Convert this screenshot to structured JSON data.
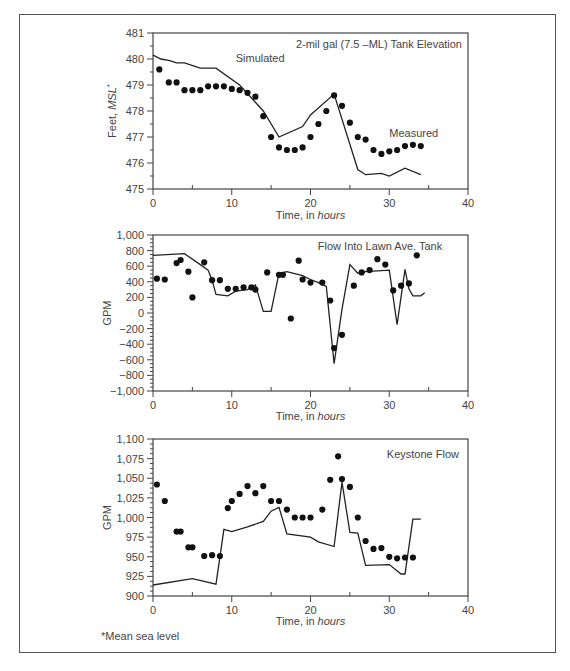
{
  "footnote": "*Mean sea level",
  "chart_data": [
    {
      "type": "line+scatter",
      "title": "2-mil gal (7.5 –ML) Tank Elevation",
      "xlabel": "Time, in hours",
      "ylabel": "Feet, MSL*",
      "xlim": [
        0,
        40
      ],
      "ylim": [
        475,
        481
      ],
      "xticks": [
        0,
        10,
        20,
        30,
        40
      ],
      "yticks": [
        475,
        476,
        477,
        478,
        479,
        480,
        481
      ],
      "ytick_labels": [
        "475",
        "476",
        "477",
        "478",
        "479",
        "480",
        "481"
      ],
      "annotations": [
        {
          "text": "Simulated",
          "x": 10.5,
          "y": 479.9
        },
        {
          "text": "Measured",
          "x": 30,
          "y": 477
        }
      ],
      "series": [
        {
          "name": "Simulated",
          "style": "line",
          "x": [
            0,
            1,
            2,
            3,
            4,
            6,
            8,
            11,
            14,
            16,
            19,
            20,
            23,
            26,
            27,
            29,
            30,
            32,
            34
          ],
          "y": [
            480.15,
            480.0,
            479.95,
            479.85,
            479.85,
            479.65,
            479.65,
            479.0,
            478.0,
            477.0,
            477.4,
            477.85,
            478.65,
            475.75,
            475.55,
            475.6,
            475.5,
            475.8,
            475.55
          ]
        },
        {
          "name": "Measured",
          "style": "dots",
          "x": [
            0.8,
            2,
            3,
            4,
            5,
            6,
            7,
            8,
            9,
            10,
            11,
            12,
            13,
            14,
            15,
            16,
            17,
            18,
            19,
            20,
            21,
            22,
            23,
            24,
            25,
            26,
            27,
            28,
            29,
            30,
            31,
            32,
            33,
            34
          ],
          "y": [
            479.6,
            479.1,
            479.1,
            478.8,
            478.8,
            478.8,
            478.95,
            478.95,
            478.95,
            478.85,
            478.8,
            478.7,
            478.55,
            477.8,
            477.0,
            476.6,
            476.5,
            476.5,
            476.6,
            477.0,
            477.5,
            478.0,
            478.6,
            478.2,
            477.55,
            477.0,
            476.9,
            476.5,
            476.35,
            476.45,
            476.5,
            476.65,
            476.7,
            476.65
          ]
        }
      ]
    },
    {
      "type": "line+scatter",
      "title": "Flow Into Lawn Ave. Tank",
      "xlabel": "",
      "ylabel": "GPM",
      "xlim": [
        0,
        40
      ],
      "ylim": [
        -1000,
        1000
      ],
      "xticks": [
        0,
        10,
        20,
        30,
        40
      ],
      "yticks": [
        -1000,
        -800,
        -600,
        -400,
        -200,
        0,
        200,
        400,
        600,
        800,
        1000
      ],
      "ytick_labels": [
        "−1,000",
        "−800",
        "−600",
        "−400",
        "−200",
        "0",
        "200",
        "400",
        "600",
        "800",
        "1,000"
      ],
      "series": [
        {
          "name": "Simulated",
          "style": "line",
          "x": [
            0,
            4,
            6,
            7,
            7.5,
            8,
            9.5,
            10.5,
            12,
            13,
            14,
            15,
            16,
            17,
            19,
            20,
            21,
            22,
            23,
            24,
            25,
            26,
            27,
            30,
            31,
            32,
            32.5,
            33,
            34,
            34.5
          ],
          "y": [
            740,
            760,
            620,
            550,
            420,
            240,
            220,
            280,
            300,
            360,
            20,
            20,
            510,
            530,
            480,
            430,
            390,
            340,
            -650,
            50,
            620,
            510,
            530,
            550,
            -150,
            560,
            310,
            220,
            220,
            260
          ]
        },
        {
          "name": "Measured",
          "style": "dots",
          "x": [
            0.5,
            1.5,
            3,
            3.5,
            4.5,
            5,
            6.5,
            7.5,
            8.5,
            9.5,
            10.5,
            11.5,
            12.5,
            13,
            14.5,
            16,
            16.5,
            17.5,
            18.5,
            19,
            20,
            21.5,
            22.5,
            23,
            24,
            25.5,
            26.5,
            27.5,
            28.5,
            29.5,
            30.5,
            31.5,
            32.5,
            33.5
          ],
          "y": [
            440,
            430,
            640,
            680,
            530,
            200,
            650,
            420,
            420,
            310,
            310,
            330,
            330,
            300,
            520,
            490,
            490,
            -70,
            670,
            430,
            390,
            390,
            160,
            -450,
            -280,
            350,
            520,
            550,
            690,
            620,
            290,
            350,
            380,
            740
          ]
        }
      ]
    },
    {
      "type": "line+scatter",
      "title": "Keystone Flow",
      "xlabel": "Time, in hours",
      "ylabel": "GPM",
      "xlim": [
        0,
        40
      ],
      "ylim": [
        900,
        1100
      ],
      "xticks": [
        0,
        10,
        20,
        30,
        40
      ],
      "yticks": [
        900,
        925,
        950,
        975,
        1000,
        1025,
        1050,
        1075,
        1100
      ],
      "ytick_labels": [
        "900",
        "925",
        "950",
        "975",
        "1,000",
        "1,025",
        "1,050",
        "1,075",
        "1,100"
      ],
      "series": [
        {
          "name": "Simulated",
          "style": "line",
          "x": [
            0,
            5,
            8,
            9,
            10,
            12,
            14,
            15,
            16,
            17,
            20,
            21,
            23,
            24,
            25,
            26,
            27,
            30,
            31.5,
            32,
            33,
            34
          ],
          "y": [
            914,
            922,
            915,
            985,
            982,
            988,
            995,
            1008,
            1013,
            979,
            975,
            969,
            963,
            1045,
            981,
            980,
            939,
            940,
            928,
            928,
            998,
            998
          ]
        },
        {
          "name": "Measured",
          "style": "dots",
          "x": [
            0.5,
            1.5,
            3,
            3.5,
            4.5,
            5,
            6.5,
            7.5,
            8.5,
            9.5,
            10,
            11,
            12,
            13,
            14,
            15,
            16,
            17,
            18,
            19,
            20,
            21.5,
            22.5,
            23.5,
            24,
            25,
            26,
            27,
            28,
            29,
            30,
            31,
            32,
            33
          ],
          "y": [
            1042,
            1021,
            982,
            982,
            962,
            962,
            951,
            952,
            951,
            1012,
            1021,
            1030,
            1040,
            1031,
            1040,
            1021,
            1021,
            1010,
            1000,
            1000,
            1000,
            1010,
            1048,
            1078,
            1049,
            1039,
            1000,
            970,
            960,
            961,
            950,
            948,
            949,
            949
          ]
        }
      ]
    }
  ]
}
